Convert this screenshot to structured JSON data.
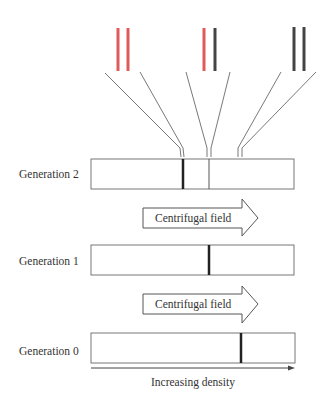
{
  "colors": {
    "heavy_strand": "#e05a5a",
    "light_strand": "#444444",
    "outline": "#777777",
    "band": "#222222"
  },
  "duplexes": [
    {
      "name": "heavy-heavy",
      "strands": [
        "heavy",
        "heavy"
      ]
    },
    {
      "name": "hybrid",
      "strands": [
        "heavy",
        "light"
      ]
    },
    {
      "name": "light-light",
      "strands": [
        "light",
        "light"
      ]
    }
  ],
  "generations": [
    {
      "label": "Generation 2",
      "bands": [
        {
          "position": "light",
          "weight": "heavy"
        },
        {
          "position": "hybrid",
          "weight": "thin"
        }
      ]
    },
    {
      "label": "Generation 1",
      "bands": [
        {
          "position": "hybrid",
          "weight": "heavy"
        }
      ]
    },
    {
      "label": "Generation 0",
      "bands": [
        {
          "position": "heavy",
          "weight": "heavy"
        }
      ]
    }
  ],
  "arrows": [
    {
      "label": "Centrifugal field"
    },
    {
      "label": "Centrifugal field"
    }
  ],
  "axis": {
    "label": "Increasing density"
  }
}
